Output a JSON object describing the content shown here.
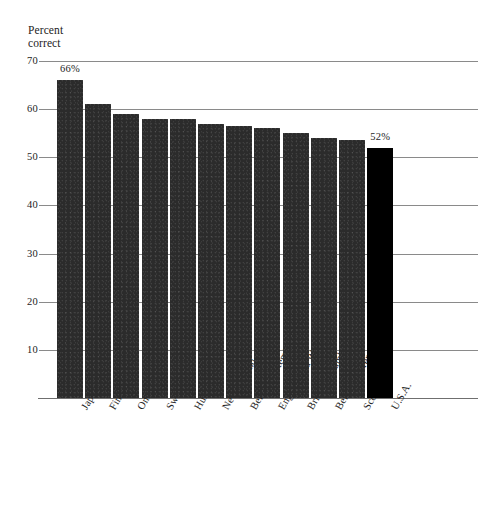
{
  "chart_data": {
    "type": "bar",
    "title": "",
    "subtitle": "",
    "xlabel": "",
    "ylabel": "Percent\ncorrect",
    "ylim": [
      0,
      70
    ],
    "yticks": [
      10,
      20,
      30,
      40,
      50,
      60,
      70
    ],
    "grid": true,
    "legend": "none",
    "categories": [
      "Japan",
      "Finland",
      "Ontario",
      "Sweden",
      "Hungary",
      "New Zealand",
      "Belgium (Flemish)",
      "England and Wales",
      "British Columbia",
      "Belgium (French)",
      "Scotland",
      "U.S.A."
    ],
    "values": [
      66,
      61,
      59,
      58,
      58,
      57,
      56.5,
      56,
      55,
      54,
      53.5,
      52
    ],
    "point_labels": [
      "66%",
      "",
      "",
      "",
      "",
      "",
      "",
      "",
      "",
      "",
      "",
      "52%"
    ],
    "highlight_index": 11,
    "colors": {
      "bar": "#2b2b2b",
      "bar_highlight": "#000000",
      "gridline": "#8a8a8a",
      "text": "#1d1d1d",
      "background": "#ffffff"
    }
  }
}
